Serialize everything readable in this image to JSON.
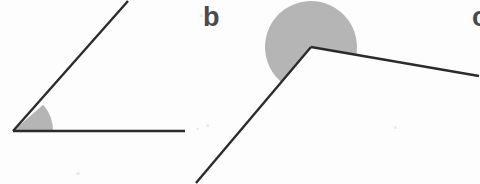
{
  "page": {
    "width": 480,
    "height": 184,
    "background_color": "#fdfdfd"
  },
  "style": {
    "line_color": "#2b2b2b",
    "line_width": 2.4,
    "shade_fill": "#b5b5b5",
    "label_color": "#4a4a4a",
    "label_font_size": 27
  },
  "labels": {
    "figure_a": "",
    "figure_b": "b",
    "figure_c": "c"
  },
  "chart_data": {
    "type": "diagram",
    "figures": [
      {
        "id": "figure-a",
        "label": "",
        "kind": "angle",
        "angle_type": "obtuse",
        "vertex": [
          13,
          131
        ],
        "rays": [
          {
            "name": "horizontal-ray",
            "to": [
              185,
              131
            ],
            "direction_deg": 0
          },
          {
            "name": "diagonal-ray",
            "to": [
              128,
              1
            ],
            "direction_deg": 41
          }
        ],
        "shade": {
          "shape": "sector",
          "radius": 40,
          "start_deg": 0,
          "end_deg": 41,
          "fill": "#b5b5b5"
        }
      },
      {
        "id": "figure-b",
        "label": "b",
        "kind": "angle",
        "angle_type": "reflex",
        "vertex": [
          311,
          47
        ],
        "rays": [
          {
            "name": "lower-left-ray",
            "to": [
              196,
              183
            ],
            "direction_deg": 229
          },
          {
            "name": "right-ray",
            "to": [
              479,
              76
            ],
            "direction_deg": 350
          }
        ],
        "shade": {
          "shape": "reflex-sector",
          "radius": 46,
          "start_deg": 350,
          "end_deg": 229,
          "fill": "#b5b5b5"
        }
      },
      {
        "id": "figure-c",
        "label": "c",
        "kind": "label-only",
        "clipped": true,
        "position": [
          472,
          4
        ]
      }
    ]
  }
}
